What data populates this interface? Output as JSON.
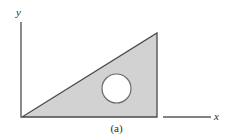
{
  "figure": {
    "caption": "(a)",
    "background_color": "#ffffff",
    "axes": {
      "y_axis": {
        "label": "y",
        "icon": "vertical-axis-line",
        "color": "#5a5a5a",
        "x": 21,
        "y_top": 22,
        "y_bottom": 117
      },
      "x_axis": {
        "label": "x",
        "icon": "horizontal-axis-line",
        "color": "#5a5a5a",
        "y": 117,
        "x_start": 163,
        "x_end": 211
      }
    },
    "shapes": {
      "triangle": {
        "name": "right-triangle-plate",
        "fill_color": "#d2d2d2",
        "stroke_color": "#4a4a4a",
        "vertices": [
          {
            "x": 22,
            "y": 117
          },
          {
            "x": 157,
            "y": 117
          },
          {
            "x": 157,
            "y": 33
          }
        ]
      },
      "hole": {
        "name": "circular-hole",
        "fill_color": "#ffffff",
        "stroke_color": "#6a6a6a",
        "center_x": 116.5,
        "center_y": 88.5,
        "radius": 14.5
      }
    }
  }
}
